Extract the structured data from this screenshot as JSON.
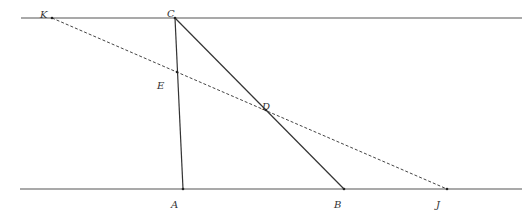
{
  "diagram": {
    "type": "geometry",
    "lines": {
      "top": {
        "x1": 21,
        "y1": 18,
        "x2": 522,
        "y2": 18
      },
      "bottom": {
        "x1": 20,
        "y1": 189,
        "x2": 522,
        "y2": 189
      }
    },
    "points": {
      "K": {
        "label": "K",
        "x": 52,
        "y": 18,
        "lx": 40,
        "ly": 18
      },
      "C": {
        "label": "C",
        "x": 175,
        "y": 18,
        "lx": 167,
        "ly": 17
      },
      "E": {
        "label": "E",
        "x": 177,
        "y": 72,
        "lx": 157,
        "ly": 89
      },
      "D": {
        "label": "D",
        "x": 266,
        "y": 110,
        "lx": 262,
        "ly": 110
      },
      "A": {
        "label": "A",
        "x": 183,
        "y": 189,
        "lx": 171,
        "ly": 208
      },
      "B": {
        "label": "B",
        "x": 344,
        "y": 189,
        "lx": 334,
        "ly": 208
      },
      "J": {
        "label": "J",
        "x": 447,
        "y": 189,
        "lx": 436,
        "ly": 208
      }
    },
    "segments": [
      {
        "from": "C",
        "to": "A",
        "style": "solid"
      },
      {
        "from": "C",
        "to": "B",
        "style": "solid"
      },
      {
        "from": "K",
        "to": "J",
        "style": "dashed"
      }
    ],
    "colors": {
      "line": "#555555",
      "segment": "#333333",
      "dashed": "#444444"
    }
  }
}
